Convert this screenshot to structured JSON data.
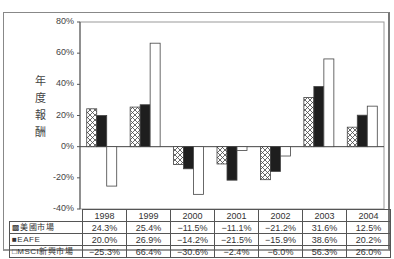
{
  "chart_data": {
    "type": "bar",
    "title": "",
    "ylabel": "年度報酬",
    "xlabel": "",
    "ylim": [
      -40,
      80
    ],
    "yticks": [
      "80%",
      "60%",
      "40%",
      "20%",
      "0%",
      "-20%",
      "-40%"
    ],
    "categories": [
      "1998",
      "1999",
      "2000",
      "2001",
      "2002",
      "2003",
      "2004"
    ],
    "series": [
      {
        "name": "美國市場",
        "pattern": "crosshatch",
        "values": [
          24.3,
          25.4,
          -11.5,
          -11.1,
          -21.2,
          31.6,
          12.5
        ],
        "labels": [
          "24.3%",
          "25.4%",
          "−11.5%",
          "−11.1%",
          "−21.2%",
          "31.6%",
          "12.5%"
        ]
      },
      {
        "name": "EAFE",
        "pattern": "solid-black",
        "values": [
          20.0,
          26.9,
          -14.2,
          -21.5,
          -15.9,
          38.6,
          20.2
        ],
        "labels": [
          "20.0%",
          "26.9%",
          "−14.2%",
          "−21.5%",
          "−15.9%",
          "38.6%",
          "20.2%"
        ]
      },
      {
        "name": "MSCI新興市場",
        "pattern": "white",
        "values": [
          -25.3,
          66.4,
          -30.6,
          -2.4,
          -6.0,
          56.3,
          26.0
        ],
        "labels": [
          "−25.3%",
          "66.4%",
          "−30.6%",
          "−2.4%",
          "−6.0%",
          "56.3%",
          "26.0%"
        ]
      }
    ],
    "grid": false,
    "legend_position": "data-table"
  },
  "ylabel_chars": [
    "年",
    "度",
    "報",
    "酬"
  ],
  "legend_rows": [
    {
      "marker": "▩",
      "label": "美國市場"
    },
    {
      "marker": "■",
      "label": "EAFE"
    },
    {
      "marker": "□",
      "label": "MSCI新興市場"
    }
  ],
  "colors": {
    "black": "#1a1a1a",
    "frame": "#888888",
    "hatch": "#555555"
  }
}
